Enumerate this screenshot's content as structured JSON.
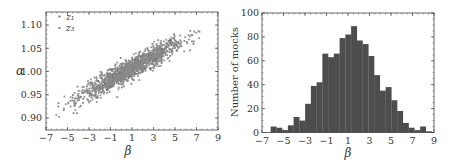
{
  "chart_data": [
    {
      "type": "scatter",
      "title": "",
      "xlabel": "β",
      "ylabel": "α",
      "xlim": [
        -7,
        9
      ],
      "ylim": [
        0.87,
        1.125
      ],
      "xticks": [
        -7,
        -5,
        -3,
        -1,
        1,
        3,
        5,
        7,
        9
      ],
      "xtick_labels": [
        "−7",
        "−5",
        "−3",
        "−1",
        "1",
        "3",
        "5",
        "7",
        "9"
      ],
      "yticks": [
        0.9,
        0.95,
        1.0,
        1.05,
        1.1
      ],
      "ytick_labels": [
        "0.90",
        "0.95",
        "1.00",
        "1.05",
        "1.10"
      ],
      "legend": {
        "position": "upper left",
        "entries": [
          "z₁",
          "z₃"
        ]
      },
      "series": [
        {
          "name": "z₁",
          "color": "#777777",
          "n_points": 700,
          "trend": {
            "slope": 0.0125,
            "intercept_at_beta_0p5": 1.0
          },
          "beta_range": [
            -6.3,
            7.5
          ],
          "alpha_range": [
            0.895,
            1.115
          ]
        },
        {
          "name": "z₃",
          "color": "#8a8a8a",
          "n_points": 700,
          "trend": {
            "slope": 0.0125,
            "intercept_at_beta_0p5": 1.0
          },
          "beta_range": [
            -6.3,
            7.5
          ],
          "alpha_range": [
            0.895,
            1.115
          ]
        }
      ],
      "grid": false
    },
    {
      "type": "bar",
      "subtype": "histogram",
      "title": "",
      "xlabel": "β",
      "ylabel": "Number of mocks",
      "xlim": [
        -7,
        9
      ],
      "ylim": [
        0,
        100
      ],
      "xticks": [
        -7,
        -5,
        -3,
        -1,
        1,
        3,
        5,
        7,
        9
      ],
      "xtick_labels": [
        "−7",
        "−5",
        "−3",
        "−1",
        "1",
        "3",
        "5",
        "7",
        "9"
      ],
      "yticks": [
        0,
        20,
        40,
        60,
        80,
        100
      ],
      "ytick_labels": [
        "0",
        "20",
        "40",
        "60",
        "80",
        "100"
      ],
      "bin_start": -6.2,
      "bin_width": 0.535,
      "bins": [
        -6.2,
        -5.67,
        -5.13,
        -4.6,
        -4.06,
        -3.53,
        -2.99,
        -2.46,
        -1.92,
        -1.39,
        -0.85,
        -0.32,
        0.22,
        0.75,
        1.29,
        1.82,
        2.36,
        2.89,
        3.43,
        3.96,
        4.5,
        5.03,
        5.57,
        6.1,
        6.64,
        7.17,
        7.71,
        8.24
      ],
      "values": [
        5,
        4,
        2,
        6,
        13,
        10,
        24,
        39,
        42,
        66,
        63,
        66,
        79,
        82,
        89,
        77,
        74,
        64,
        48,
        35,
        38,
        27,
        18,
        8,
        4,
        2,
        5,
        1
      ],
      "color": "#4d4d4d",
      "grid": false
    }
  ]
}
